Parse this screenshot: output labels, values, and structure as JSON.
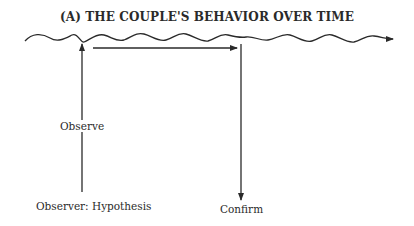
{
  "diagram": {
    "title": "(A) THE COUPLE'S BEHAVIOR OVER TIME",
    "labels": {
      "observe": "Observe",
      "hypothesis": "Observer: Hypothesis",
      "confirm": "Confirm"
    },
    "elements": [
      {
        "type": "wavy-arrow",
        "meaning": "behavior over time timeline"
      },
      {
        "type": "up-arrow",
        "label": "Observe"
      },
      {
        "type": "right-arrow"
      },
      {
        "type": "down-arrow",
        "label": "Confirm"
      }
    ],
    "colors": {
      "ink": "#2a2a2a",
      "background": "#ffffff"
    }
  }
}
